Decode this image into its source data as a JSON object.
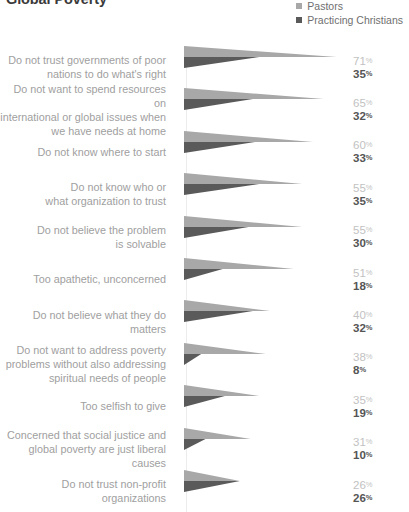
{
  "title": "Global Poverty",
  "legend": {
    "position": "top-right",
    "items": [
      {
        "label": "Pastors",
        "color": "#a8a8a8",
        "icon": "square-swatch-icon"
      },
      {
        "label": "Practicing Christians",
        "color": "#5a5a5a",
        "icon": "square-swatch-icon"
      }
    ]
  },
  "colors": {
    "pastors": "#a8a8a8",
    "practicing_christians": "#5a5a5a",
    "label_text": "#a0a0a0",
    "value_pastors_text": "#c2c2c2",
    "value_christians_text": "#555555",
    "background": "#ffffff",
    "divider": "#ececec"
  },
  "chart_data": {
    "type": "bar",
    "title": "Global Poverty",
    "xlabel": "",
    "ylabel": "",
    "xlim": [
      0,
      100
    ],
    "grid": false,
    "legend_position": "top-right",
    "note": "Horizontal tapered-wedge bars; wedge length encodes percent.",
    "categories": [
      "Do not trust governments of poor nations to do what's right",
      "Do not want to spend resources on international or global issues when we have needs at home",
      "Do not know where to start",
      "Do not know who or what organization to trust",
      "Do not believe the problem is solvable",
      "Too apathetic, unconcerned",
      "Do not believe what they do matters",
      "Do not want to address poverty problems without also addressing spiritual needs of people",
      "Too selfish to give",
      "Concerned that social justice and global poverty are just liberal causes",
      "Do not trust non-profit organizations"
    ],
    "series": [
      {
        "name": "Pastors",
        "color": "#a8a8a8",
        "values": [
          71,
          65,
          60,
          55,
          55,
          51,
          40,
          38,
          35,
          31,
          26
        ]
      },
      {
        "name": "Practicing Christians",
        "color": "#5a5a5a",
        "values": [
          35,
          32,
          33,
          35,
          30,
          18,
          32,
          8,
          19,
          10,
          26
        ]
      }
    ]
  },
  "rows": [
    {
      "label": "Do not trust governments of poor\nnations to do what's right",
      "pastors": "71",
      "christians": "35",
      "pastors_value": 71,
      "christians_value": 35
    },
    {
      "label": "Do not want to spend resources on\ninternational or global issues when\nwe have needs at home",
      "pastors": "65",
      "christians": "32",
      "pastors_value": 65,
      "christians_value": 32
    },
    {
      "label": "Do not know where to start",
      "pastors": "60",
      "christians": "33",
      "pastors_value": 60,
      "christians_value": 33
    },
    {
      "label": "Do not know who or\nwhat organization to trust",
      "pastors": "55",
      "christians": "35",
      "pastors_value": 55,
      "christians_value": 35
    },
    {
      "label": "Do not believe the problem\nis solvable",
      "pastors": "55",
      "christians": "30",
      "pastors_value": 55,
      "christians_value": 30
    },
    {
      "label": "Too apathetic, unconcerned",
      "pastors": "51",
      "christians": "18",
      "pastors_value": 51,
      "christians_value": 18
    },
    {
      "label": "Do not believe what they do matters",
      "pastors": "40",
      "christians": "32",
      "pastors_value": 40,
      "christians_value": 32
    },
    {
      "label": "Do not want to address poverty\nproblems without also addressing\nspiritual needs of people",
      "pastors": "38",
      "christians": "8",
      "pastors_value": 38,
      "christians_value": 8
    },
    {
      "label": "Too selfish to give",
      "pastors": "35",
      "christians": "19",
      "pastors_value": 35,
      "christians_value": 19
    },
    {
      "label": "Concerned that social justice and\nglobal poverty are just liberal causes",
      "pastors": "31",
      "christians": "10",
      "pastors_value": 31,
      "christians_value": 10
    },
    {
      "label": "Do not trust non-profit\norganizations",
      "pastors": "26",
      "christians": "26",
      "pastors_value": 26,
      "christians_value": 26
    }
  ],
  "percent_symbol": "%"
}
